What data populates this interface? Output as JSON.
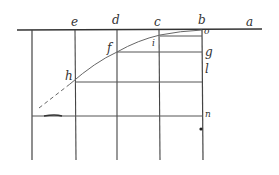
{
  "diagram": {
    "type": "geometric-construction",
    "labels": {
      "a": "a",
      "b": "b",
      "c": "c",
      "d": "d",
      "e": "e",
      "f": "f",
      "g": "g",
      "h": "h",
      "i": "i",
      "l": "l",
      "n": "n",
      "o": "o"
    },
    "colors": {
      "line": "#444444",
      "curve": "#666666",
      "background": "#ffffff"
    }
  }
}
